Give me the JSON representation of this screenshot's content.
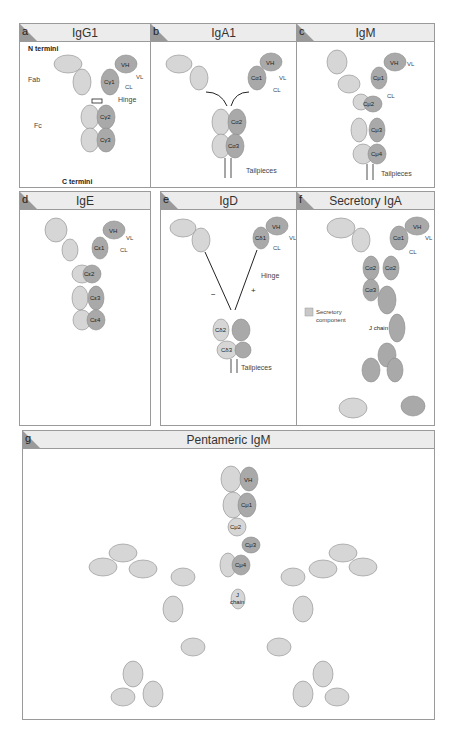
{
  "panels": {
    "a": {
      "letter": "a",
      "title": "IgG1",
      "labels": {
        "n_termini": "N termini",
        "c_termini": "C termini",
        "fab": "Fab",
        "fc": "Fc",
        "hinge": "Hinge",
        "vh": "VH",
        "vl": "VL",
        "cl": "CL",
        "ch1": "Cγ1",
        "ch2": "Cγ2",
        "ch3": "Cγ3"
      }
    },
    "b": {
      "letter": "b",
      "title": "IgA1",
      "labels": {
        "vh": "VH",
        "vl": "VL",
        "cl": "CL",
        "ch1": "Cα1",
        "ch2": "Cα2",
        "ch3": "Cα3",
        "tailpieces": "Tailpieces"
      }
    },
    "c": {
      "letter": "c",
      "title": "IgM",
      "labels": {
        "vh": "VH",
        "vl": "VL",
        "cl": "CL",
        "ch1": "Cμ1",
        "ch2": "Cμ2",
        "ch3": "Cμ3",
        "ch4": "Cμ4",
        "tailpieces": "Tailpieces"
      }
    },
    "d": {
      "letter": "d",
      "title": "IgE",
      "labels": {
        "vh": "VH",
        "vl": "VL",
        "cl": "CL",
        "ch1": "Cε1",
        "ch2": "Cε2",
        "ch3": "Cε3",
        "ch4": "Cε4"
      }
    },
    "e": {
      "letter": "e",
      "title": "IgD",
      "labels": {
        "vh": "VH",
        "vl": "VL",
        "cl": "CL",
        "ch1": "Cδ1",
        "ch2": "Cδ2",
        "ch3": "Cδ3",
        "hinge": "Hinge",
        "tailpieces": "Tailpieces",
        "minus": "−",
        "plus": "+"
      }
    },
    "f": {
      "letter": "f",
      "title": "Secretory IgA",
      "labels": {
        "vh": "VH",
        "vl": "VL",
        "cl": "CL",
        "ch1": "Cα1",
        "ch2": "Cα2",
        "ch2b": "Cα2",
        "ch3": "Cα3",
        "j_chain": "J chain",
        "legend_line1": "Secretory",
        "legend_line2": "component"
      }
    },
    "g": {
      "letter": "g",
      "title": "Pentameric IgM",
      "labels": {
        "vh": "VH",
        "ch1": "Cμ1",
        "ch2": "Cμ2",
        "ch3": "Cμ3",
        "ch4": "Cμ4",
        "j_line1": "J",
        "j_line2": "chain"
      }
    }
  },
  "colors": {
    "heavy": "#a9a9a9",
    "light": "#d6d6d6",
    "pale": "#e8e8e8",
    "stroke": "#8a8a8a",
    "header": "#ececec",
    "border": "#9a9a9a"
  }
}
